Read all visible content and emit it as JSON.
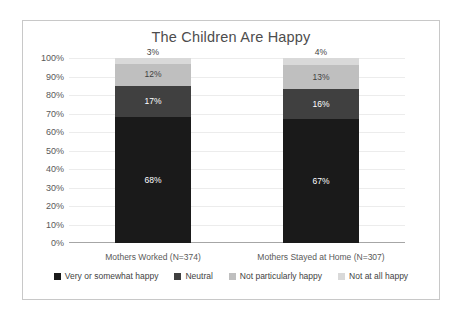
{
  "chart_data": {
    "type": "bar",
    "subtype": "stacked-percent",
    "title": "The Children Are Happy",
    "xlabel": "",
    "ylabel": "",
    "ylim": [
      0,
      100
    ],
    "ytick_labels": [
      "100%",
      "90%",
      "80%",
      "70%",
      "60%",
      "50%",
      "40%",
      "30%",
      "20%",
      "10%",
      "0%"
    ],
    "ytick_values": [
      100,
      90,
      80,
      70,
      60,
      50,
      40,
      30,
      20,
      10,
      0
    ],
    "grid": true,
    "legend_position": "bottom",
    "categories": [
      "Mothers Worked (N=374)",
      "Mothers Stayed at Home (N=307)"
    ],
    "series": [
      {
        "name": "Very or somewhat happy",
        "color": "#1a1a1a",
        "values": [
          68,
          67
        ],
        "labels": [
          "68%",
          "67%"
        ]
      },
      {
        "name": "Neutral",
        "color": "#404040",
        "values": [
          17,
          16
        ],
        "labels": [
          "17%",
          "16%"
        ]
      },
      {
        "name": "Not particularly happy",
        "color": "#bfbfbf",
        "values": [
          12,
          13
        ],
        "labels": [
          "12%",
          "13%"
        ]
      },
      {
        "name": "Not at all happy",
        "color": "#d9d9d9",
        "values": [
          3,
          4
        ],
        "labels": [
          "3%",
          "4%"
        ]
      }
    ]
  },
  "colors": {
    "frame": "#c8c8c8",
    "gridline": "#ececec",
    "axis": "#a6a6a6",
    "title_text": "#4d4d4d",
    "tick_text": "#595959",
    "label_light": "#3f3f3f",
    "label_dark": "#ffffff"
  }
}
